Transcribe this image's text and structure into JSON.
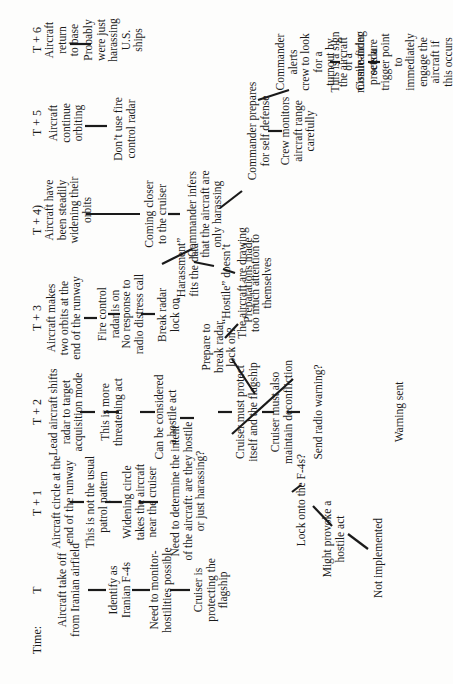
{
  "time_axis": {
    "label": "Time:",
    "steps": [
      "T",
      "T + 1",
      "T + 2",
      "T + 3",
      "T + 4)",
      "T + 5",
      "T + 6"
    ]
  },
  "nodes": {
    "t0_event": "Aircraft take off\nfrom Iranian airfield",
    "t0_identify": "Identify as\nIranian F-4s",
    "t0_monitor": "Need to monitor-\nhostilities possible",
    "t0_protecting": "Cruiser is\nprotecting the\nflagship",
    "t1_event": "Aircraft circle at the\nend of the runway",
    "t1_not_usual": "This is not the usual\npatrol pattern",
    "t1_widening": "Widening circle\ntakes the aircraft\nnear the cruiser",
    "t1_determine": "Need to determine the intent\nof the aircraft: are they hostile\nor just harassing?",
    "t1_lock_onto": "Lock onto the F-4s?",
    "t1_provoke": "Might provoke a\nhostile act",
    "t1_not_implemented": "Not implemented",
    "t2_event": "Lead aircraft shifts\nradar to target\nacquisition mode",
    "t2_threatening": "This is more\nthreatening act",
    "t2_hostile_act": "Can be considered\na hostile act",
    "t2_protect": "Cruiser must protect\nitself and the flagship",
    "t2_deconfliction": "Cruiser must also\nmaintain deconfliction",
    "t2_send_warning": "Send radio warning?",
    "t2_warning_sent": "Warning sent",
    "t3_event": "Aircraft makes\ntwo orbits at the\nend of the runway",
    "t3_fire_control": "Fire control\nradar is on",
    "t3_no_response": "No response to\nradio distress call",
    "t3_break_lock": "Break radar\nlock on",
    "t3_harassment": "“Harassment”\nfits the data",
    "t3_hostile_doesnt": "“Hostile” doesn’t",
    "t3_attention": "The aircraft are drawing\ntoo much attention to\nthemselves",
    "t3_prepare_break": "Prepare to\nbreak radar\nlock on?",
    "t3_preparations": "Preparations made",
    "t4_event": "Aircraft have\nbeen steadily\nwidening their\norbits",
    "t4_closer": "Coming closer\nto the cruiser",
    "t4_infers": "Commander infers\nthat the aircraft are\nonly harassing",
    "t4_self_defense": "Commander prepares\nfor self defense",
    "t4_range": "Crew monitors\naircraft range\ncarefully",
    "t5_event": "Aircraft\ncontinue\norbiting",
    "t5_no_fire_control": "Don’t use fire\ncontrol radar",
    "t5_alerts": "Commander alerts\ncrew to look for a\nturnout by the aircraft",
    "t5_missile_sign": "This is a sign of a\nmissile-firing\nprocedure",
    "t5_trigger": "Commander sets a\ntrigger point to\nimmediately engage the\naircraft if this occurs",
    "t6_event": "Aircraft return\nto base",
    "t6_harassing": "Probably\nwere just\nharassing\nU.S. ships"
  }
}
